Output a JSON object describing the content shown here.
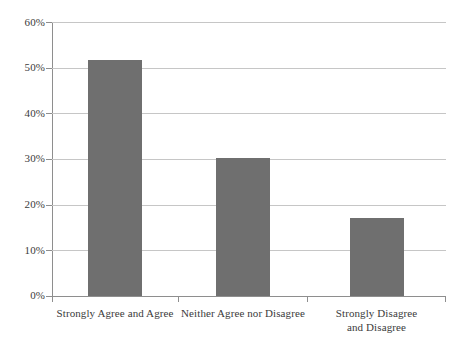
{
  "chart_data": {
    "type": "bar",
    "title": "",
    "subtitle": "",
    "xlabel": "",
    "ylabel": "",
    "categories": [
      "Strongly Agree and Agree",
      "Neither Agree nor Disagree",
      "Strongly Disagree\nand Disagree"
    ],
    "values": [
      51.7,
      30.2,
      17.1
    ],
    "value_labels": [
      "",
      "",
      ""
    ],
    "ylim": [
      0,
      60
    ],
    "ytick_values": [
      0,
      10,
      20,
      30,
      40,
      50,
      60
    ],
    "ytick_labels": [
      "0%",
      "10%",
      "20%",
      "30%",
      "40%",
      "50%",
      "60%"
    ],
    "grid": true,
    "grid_axis": "y",
    "legend": false,
    "legend_position": "none",
    "series": [
      {
        "name": "",
        "values": [
          51.7,
          30.2,
          17.1
        ]
      }
    ]
  },
  "style": {
    "bar_color": "#6f6f6f",
    "gridline_color": "#c6c6c6",
    "axis_color": "#8e8e8e",
    "text_color": "#3b3b3b",
    "background_color": "#ffffff"
  }
}
